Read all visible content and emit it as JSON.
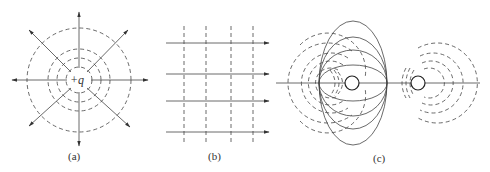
{
  "figure": {
    "panels": [
      {
        "id": "a",
        "label": "(a)",
        "description": "Point charge +q: radial field lines (arrows outward) with concentric dashed equipotential circles",
        "charge_label": "+q"
      },
      {
        "id": "b",
        "label": "(b)",
        "description": "Uniform field: parallel horizontal field lines with arrows, vertical dashed equipotential lines"
      },
      {
        "id": "c",
        "label": "(c)",
        "description": "Two charges: solid field lines connecting the charges, dashed equipotential curves around each charge"
      }
    ]
  }
}
